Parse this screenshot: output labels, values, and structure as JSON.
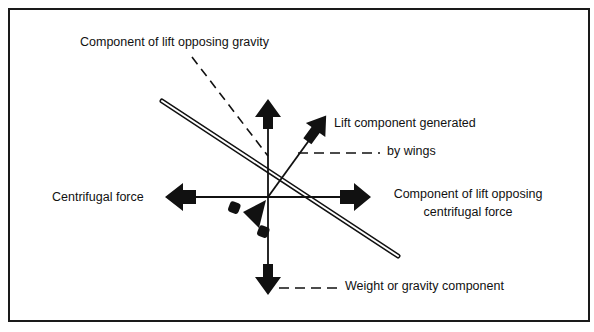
{
  "diagram": {
    "labels": {
      "lift_opposing_gravity": "Component of lift opposing gravity",
      "lift_generated_line1": "Lift component generated",
      "lift_generated_line2": "by wings",
      "centrifugal_force": "Centrifugal force",
      "lift_opposing_centrifugal_line1": "Component of lift opposing",
      "lift_opposing_centrifugal_line2": "centrifugal force",
      "weight_component": "Weight or gravity component"
    },
    "colors": {
      "ink": "#111111",
      "background": "#ffffff"
    }
  }
}
